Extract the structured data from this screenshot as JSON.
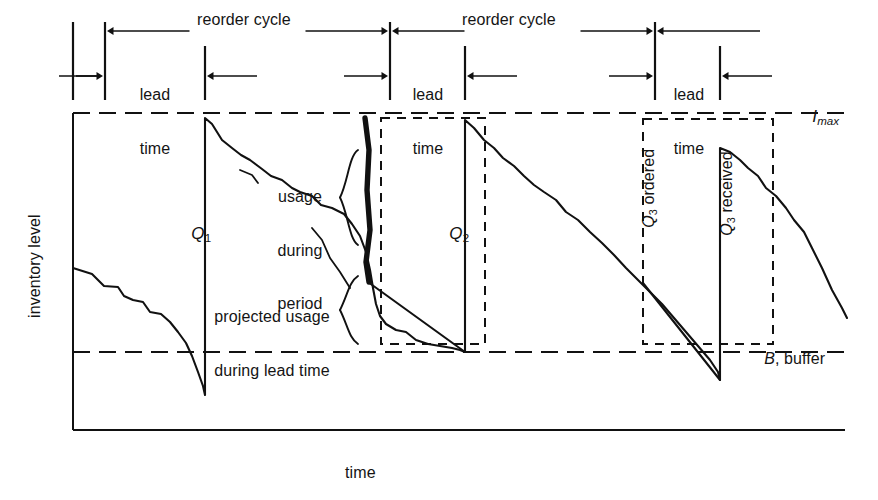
{
  "figure": {
    "type": "inventory-sawtooth-diagram",
    "title_visible": false,
    "background": "#ffffff",
    "ink": "#111111"
  },
  "axes": {
    "y_label": "inventory level",
    "x_label": "time",
    "x_arrow": "─────▶",
    "y_axis_x": 73,
    "x_axis_y": 430,
    "plot_right": 845,
    "plot_top": 113
  },
  "reference_lines": [
    {
      "name": "i-max-line",
      "label_main": "I",
      "label_sub": "max",
      "style": "dashed",
      "y": 113
    },
    {
      "name": "buffer-line",
      "label_main": "B",
      "label_rest": ", buffer",
      "style": "dashed",
      "y": 352
    }
  ],
  "top_scale": {
    "reorder_cycles": [
      {
        "label": "reorder cycle",
        "from_x": 105,
        "to_x": 390
      },
      {
        "label": "reorder cycle",
        "from_x": 390,
        "to_x": 655
      }
    ],
    "lead_times": [
      {
        "label_line1": "lead",
        "label_line2": "time",
        "from_x": 105,
        "to_x": 205
      },
      {
        "label_line1": "lead",
        "label_line2": "time",
        "from_x": 390,
        "to_x": 465
      },
      {
        "label_line1": "lead",
        "label_line2": "time",
        "from_x": 655,
        "to_x": 720
      }
    ]
  },
  "order_quantities": [
    {
      "name": "Q1",
      "main": "Q",
      "sub": "1",
      "x": 182,
      "y": 213,
      "rotated": false
    },
    {
      "name": "Q2",
      "main": "Q",
      "sub": "2",
      "x": 440,
      "y": 213,
      "rotated": false
    },
    {
      "name": "Q3-ordered",
      "main": "Q",
      "sub": "3",
      "rest": " ordered",
      "x": 622,
      "y": 232,
      "rotated": true
    },
    {
      "name": "Q3-received",
      "main": "Q",
      "sub": "3",
      "rest": " received",
      "x": 700,
      "y": 238,
      "rotated": true
    }
  ],
  "annotations": [
    {
      "name": "usage-during-period",
      "lines": [
        "usage",
        "during",
        "period"
      ],
      "brace": "right",
      "x": 268,
      "y": 160
    },
    {
      "name": "projected-usage-during-lead-time",
      "lines": [
        "projected usage",
        "during lead time"
      ],
      "brace": "right",
      "x": 196,
      "y": 279
    }
  ],
  "dashed_boxes": [
    {
      "name": "projection-box-2",
      "x": 381,
      "y": 118,
      "w": 104,
      "h": 226
    },
    {
      "name": "projection-box-3",
      "x": 643,
      "y": 119,
      "w": 130,
      "h": 225
    }
  ],
  "chart_data": {
    "type": "line",
    "xlabel": "time",
    "ylabel": "inventory level",
    "grid": false,
    "legend": null,
    "annotations": [
      "reorder cycle",
      "lead time",
      "usage during period",
      "projected usage during lead time",
      "I max",
      "B, buffer",
      "Q1",
      "Q2",
      "Q3 ordered",
      "Q3 received"
    ],
    "levels": {
      "I_max": 113,
      "buffer": 352,
      "baseline": 430
    },
    "replenishment_events_x": [
      205,
      465,
      720
    ],
    "series": [
      {
        "name": "actual inventory level",
        "style": "solid irregular sawtooth",
        "points": [
          [
            73,
            268
          ],
          [
            92,
            274
          ],
          [
            104,
            286
          ],
          [
            118,
            287
          ],
          [
            124,
            296
          ],
          [
            133,
            300
          ],
          [
            143,
            302
          ],
          [
            150,
            312
          ],
          [
            161,
            314
          ],
          [
            170,
            322
          ],
          [
            178,
            332
          ],
          [
            186,
            343
          ],
          [
            192,
            356
          ],
          [
            198,
            372
          ],
          [
            203,
            386
          ],
          [
            205,
            395
          ],
          [
            205,
            118
          ],
          [
            212,
            124
          ],
          [
            222,
            140
          ],
          [
            232,
            148
          ],
          [
            241,
            155
          ],
          [
            250,
            160
          ],
          [
            262,
            169
          ],
          [
            271,
            176
          ],
          [
            282,
            180
          ],
          [
            292,
            188
          ],
          [
            300,
            192
          ],
          [
            312,
            196
          ],
          [
            321,
            205
          ],
          [
            332,
            208
          ],
          [
            344,
            214
          ],
          [
            352,
            224
          ],
          [
            360,
            236
          ],
          [
            366,
            252
          ],
          [
            370,
            270
          ],
          [
            373,
            288
          ],
          [
            376,
            304
          ],
          [
            380,
            316
          ],
          [
            386,
            324
          ],
          [
            396,
            330
          ],
          [
            406,
            332
          ],
          [
            416,
            340
          ],
          [
            428,
            344
          ],
          [
            440,
            346
          ],
          [
            452,
            348
          ],
          [
            460,
            350
          ],
          [
            465,
            352
          ],
          [
            465,
            120
          ],
          [
            474,
            128
          ],
          [
            484,
            140
          ],
          [
            494,
            148
          ],
          [
            503,
            158
          ],
          [
            514,
            166
          ],
          [
            524,
            176
          ],
          [
            534,
            185
          ],
          [
            544,
            192
          ],
          [
            556,
            200
          ],
          [
            566,
            212
          ],
          [
            578,
            220
          ],
          [
            590,
            232
          ],
          [
            602,
            243
          ],
          [
            614,
            255
          ],
          [
            626,
            268
          ],
          [
            638,
            280
          ],
          [
            650,
            292
          ],
          [
            662,
            304
          ],
          [
            674,
            318
          ],
          [
            686,
            332
          ],
          [
            698,
            346
          ],
          [
            710,
            360
          ],
          [
            718,
            372
          ],
          [
            720,
            380
          ],
          [
            720,
            148
          ],
          [
            730,
            152
          ],
          [
            740,
            160
          ],
          [
            748,
            168
          ],
          [
            758,
            176
          ],
          [
            766,
            188
          ],
          [
            776,
            196
          ],
          [
            786,
            208
          ],
          [
            794,
            220
          ],
          [
            804,
            232
          ],
          [
            812,
            248
          ],
          [
            822,
            268
          ],
          [
            832,
            290
          ],
          [
            842,
            308
          ],
          [
            847,
            318
          ]
        ]
      },
      {
        "name": "projected usage during lead time (cycle 2)",
        "style": "solid straight",
        "points": [
          [
            368,
            282
          ],
          [
            465,
            352
          ]
        ]
      },
      {
        "name": "projected usage during lead time (cycle 3)",
        "style": "solid straight",
        "points": [
          [
            643,
            283
          ],
          [
            720,
            380
          ]
        ]
      }
    ]
  }
}
